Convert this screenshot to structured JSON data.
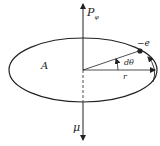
{
  "diagram": {
    "labels": {
      "p_phi": "P",
      "p_phi_sub": "φ",
      "area": "A",
      "charge": "−e",
      "angle": "dθ",
      "radius": "r",
      "moment": "μ"
    },
    "colors": {
      "stroke": "#222222",
      "background": "#ffffff"
    }
  }
}
